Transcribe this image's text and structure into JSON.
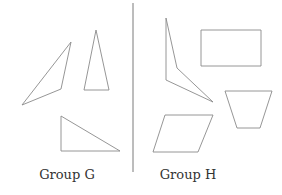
{
  "groups": [
    {
      "label": "Group G",
      "label_x": 67,
      "shapes": [
        {
          "name": "obtuse-triangle",
          "points": "71,42 61,89 22,105"
        },
        {
          "name": "acute-isosceles-triangle",
          "points": "96,30 109,90 84,90"
        },
        {
          "name": "right-triangle",
          "points": "61,116 120,151 61,151"
        }
      ]
    },
    {
      "label": "Group H",
      "label_x": 188,
      "shapes": [
        {
          "name": "concave-quadrilateral",
          "points": "166,18 177,68 213,102 166,80"
        },
        {
          "name": "rectangle",
          "points": "201,30 261,30 261,66 201,66"
        },
        {
          "name": "trapezoid",
          "points": "225,91 272,91 260,128 237,128"
        },
        {
          "name": "parallelogram",
          "points": "165,115 213,115 198,152 153,152"
        }
      ]
    }
  ],
  "divider": {
    "x": 133,
    "y1": 3,
    "y2": 172
  },
  "colors": {
    "stroke": "#8a8a8a",
    "text": "#333333"
  }
}
